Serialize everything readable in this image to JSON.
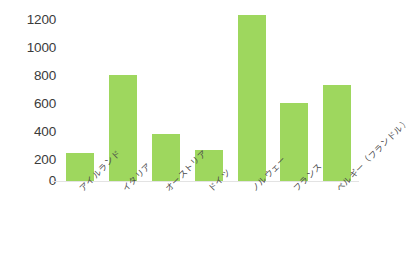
{
  "chart_data": {
    "type": "bar",
    "title": "",
    "subtitle": "",
    "xlabel": "",
    "ylabel": "",
    "categories": [
      "アイルランド",
      "イタリア",
      "オーストリア",
      "ドイツ",
      "ノルウェー",
      "フランス",
      "ベルギー（フランドル）"
    ],
    "values": [
      200,
      760,
      340,
      220,
      1190,
      560,
      690
    ],
    "ylim": [
      0,
      1200
    ],
    "yticks": [
      0,
      200,
      400,
      600,
      800,
      1000,
      1200
    ],
    "ytick_labels": [
      "0",
      "200",
      "400",
      "600",
      "800",
      "1000",
      "1200"
    ],
    "grid": false,
    "legend": false,
    "legend_position": "none",
    "bar_color": "#9ed75e",
    "axis_color": "#e3e3e3",
    "tick_label_color": "#3b3b3b",
    "category_label_color": "#4a4a4a",
    "background_color": "#ffffff"
  }
}
